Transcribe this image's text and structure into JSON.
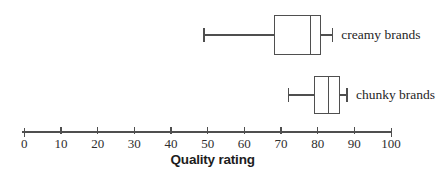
{
  "chart_data": {
    "type": "boxplot",
    "orientation": "horizontal",
    "xlabel": "Quality rating",
    "axis": {
      "min": 0,
      "max": 100,
      "tick_step": 10,
      "tick_labels": [
        "0",
        "10",
        "20",
        "30",
        "40",
        "50",
        "60",
        "70",
        "80",
        "90",
        "100"
      ]
    },
    "series": [
      {
        "name": "creamy brands",
        "min": 49,
        "q1": 68,
        "median": 78,
        "q3": 81,
        "max": 84
      },
      {
        "name": "chunky brands",
        "min": 72,
        "q1": 79,
        "median": 83,
        "q3": 86,
        "max": 88
      }
    ],
    "colors": {
      "line": "#4f4f4f",
      "box_fill": "#ffffff",
      "label_text": "#262626",
      "background": "#ffffff"
    }
  }
}
